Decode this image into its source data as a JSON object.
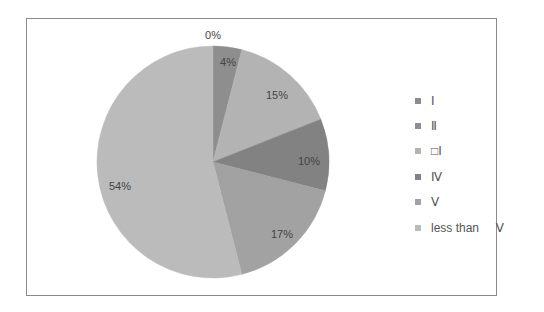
{
  "chart_data": {
    "type": "pie",
    "title": "",
    "categories": [
      "Ⅰ",
      "Ⅱ",
      "Ⅲ",
      "Ⅳ",
      "Ⅴ",
      "less than Ⅴ"
    ],
    "values": [
      0,
      4,
      15,
      10,
      17,
      54
    ],
    "value_labels": [
      "0%",
      "4%",
      "15%",
      "10%",
      "17%",
      "54%"
    ],
    "colors": [
      "#8c8c8c",
      "#8e8e8e",
      "#b3b3b3",
      "#828282",
      "#a2a2a2",
      "#bbbbbb"
    ],
    "legend_position": "right",
    "start_angle_deg": 0,
    "direction": "clockwise"
  },
  "legend": {
    "items": [
      {
        "label": "Ⅰ",
        "color": "#8c8c8c"
      },
      {
        "label": "Ⅱ",
        "color": "#8e8e8e"
      },
      {
        "label": "□Ⅰ",
        "color": "#b3b3b3"
      },
      {
        "label": "Ⅳ",
        "color": "#828282"
      },
      {
        "label": "Ⅴ",
        "color": "#a2a2a2"
      },
      {
        "label": "less than     Ⅴ",
        "color": "#bbbbbb"
      }
    ]
  },
  "labels": {
    "l0": "0%",
    "l1": "4%",
    "l2": "15%",
    "l3": "10%",
    "l4": "17%",
    "l5": "54%"
  }
}
